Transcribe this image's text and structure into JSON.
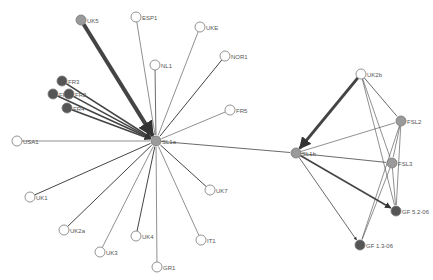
{
  "diagram": {
    "type": "network",
    "colors": {
      "node_white": "#ffffff",
      "node_gray": "#9a9a9a",
      "node_dark": "#555555",
      "node_stroke": "#777777",
      "edge": "#444444"
    },
    "nodes": [
      {
        "id": "UK5",
        "label": "UK5",
        "x": 81,
        "y": 20,
        "fill": "gray"
      },
      {
        "id": "ESP1",
        "label": "ESP1",
        "x": 136,
        "y": 17,
        "fill": "white"
      },
      {
        "id": "UKE",
        "label": "UKE",
        "x": 200,
        "y": 27,
        "fill": "white"
      },
      {
        "id": "NL1",
        "label": "NL1",
        "x": 155,
        "y": 65,
        "fill": "white"
      },
      {
        "id": "NOR1",
        "label": "NOR1",
        "x": 225,
        "y": 56,
        "fill": "white"
      },
      {
        "id": "FR5",
        "label": "FR5",
        "x": 230,
        "y": 110,
        "fill": "white"
      },
      {
        "id": "FR3",
        "label": "FR3",
        "x": 62,
        "y": 81,
        "fill": "dark"
      },
      {
        "id": "FR1",
        "label": "FR1",
        "x": 53,
        "y": 94,
        "fill": "dark"
      },
      {
        "id": "FR2",
        "label": "FR2",
        "x": 69,
        "y": 94,
        "fill": "dark"
      },
      {
        "id": "FR4",
        "label": "FR4",
        "x": 67,
        "y": 108,
        "fill": "dark"
      },
      {
        "id": "USA1",
        "label": "USA1",
        "x": 17,
        "y": 141,
        "fill": "white"
      },
      {
        "id": "UK1",
        "label": "UK1",
        "x": 30,
        "y": 197,
        "fill": "white"
      },
      {
        "id": "UK2a",
        "label": "UK2a",
        "x": 64,
        "y": 230,
        "fill": "white"
      },
      {
        "id": "UK3",
        "label": "UK3",
        "x": 100,
        "y": 252,
        "fill": "white"
      },
      {
        "id": "UK4",
        "label": "UK4",
        "x": 136,
        "y": 236,
        "fill": "white"
      },
      {
        "id": "GR1",
        "label": "GR1",
        "x": 157,
        "y": 267,
        "fill": "white"
      },
      {
        "id": "IT1",
        "label": "IT1",
        "x": 201,
        "y": 240,
        "fill": "white"
      },
      {
        "id": "UK7",
        "label": "UK7",
        "x": 210,
        "y": 190,
        "fill": "white"
      },
      {
        "id": "SL1a",
        "label": "SL1a",
        "x": 156,
        "y": 141,
        "fill": "gray"
      },
      {
        "id": "SL1b",
        "label": "SL1b",
        "x": 296,
        "y": 153,
        "fill": "gray"
      },
      {
        "id": "UK2b",
        "label": "UK2b",
        "x": 361,
        "y": 74,
        "fill": "white"
      },
      {
        "id": "FSL2",
        "label": "FSL2",
        "x": 401,
        "y": 121,
        "fill": "gray"
      },
      {
        "id": "FSL3",
        "label": "FSL3",
        "x": 392,
        "y": 163,
        "fill": "gray"
      },
      {
        "id": "GF52",
        "label": "GF 5.2-06",
        "x": 396,
        "y": 211,
        "fill": "dark"
      },
      {
        "id": "GF13",
        "label": "GF 1.3-06",
        "x": 360,
        "y": 245,
        "fill": "dark"
      }
    ],
    "edges": [
      {
        "from": "UK5",
        "to": "SL1a",
        "width": 4,
        "arrow": true
      },
      {
        "from": "ESP1",
        "to": "SL1a",
        "width": 0.6
      },
      {
        "from": "UKE",
        "to": "SL1a",
        "width": 0.6
      },
      {
        "from": "NL1",
        "to": "SL1a",
        "width": 0.8
      },
      {
        "from": "NOR1",
        "to": "SL1a",
        "width": 1
      },
      {
        "from": "FR5",
        "to": "SL1a",
        "width": 0.6
      },
      {
        "from": "FR3",
        "to": "SL1a",
        "width": 1.6,
        "arrow": true
      },
      {
        "from": "FR1",
        "to": "SL1a",
        "width": 1.6,
        "arrow": true
      },
      {
        "from": "FR2",
        "to": "SL1a",
        "width": 1.6,
        "arrow": true
      },
      {
        "from": "FR4",
        "to": "SL1a",
        "width": 1.6,
        "arrow": true
      },
      {
        "from": "USA1",
        "to": "SL1a",
        "width": 0.6
      },
      {
        "from": "UK1",
        "to": "SL1a",
        "width": 1
      },
      {
        "from": "UK2a",
        "to": "SL1a",
        "width": 1
      },
      {
        "from": "UK3",
        "to": "SL1a",
        "width": 0.6
      },
      {
        "from": "UK4",
        "to": "SL1a",
        "width": 1
      },
      {
        "from": "GR1",
        "to": "SL1a",
        "width": 0.6
      },
      {
        "from": "IT1",
        "to": "SL1a",
        "width": 0.6
      },
      {
        "from": "UK7",
        "to": "SL1a",
        "width": 1
      },
      {
        "from": "SL1a",
        "to": "SL1b",
        "width": 0.8
      },
      {
        "from": "UK2b",
        "to": "SL1b",
        "width": 3,
        "arrow": true
      },
      {
        "from": "UK2b",
        "to": "FSL2",
        "width": 0.8
      },
      {
        "from": "UK2b",
        "to": "FSL3",
        "width": 0.6
      },
      {
        "from": "UK2b",
        "to": "GF52",
        "width": 0.6
      },
      {
        "from": "SL1b",
        "to": "FSL2",
        "width": 0.6
      },
      {
        "from": "SL1b",
        "to": "FSL3",
        "width": 0.8
      },
      {
        "from": "SL1b",
        "to": "GF52",
        "width": 1.6,
        "arrow": true
      },
      {
        "from": "SL1b",
        "to": "GF13",
        "width": 0.8,
        "arrow": true
      },
      {
        "from": "FSL2",
        "to": "FSL3",
        "width": 0.6
      },
      {
        "from": "FSL2",
        "to": "GF52",
        "width": 0.6
      },
      {
        "from": "FSL2",
        "to": "GF13",
        "width": 0.6
      },
      {
        "from": "FSL3",
        "to": "GF52",
        "width": 0.6
      },
      {
        "from": "FSL3",
        "to": "GF13",
        "width": 0.6
      }
    ]
  }
}
